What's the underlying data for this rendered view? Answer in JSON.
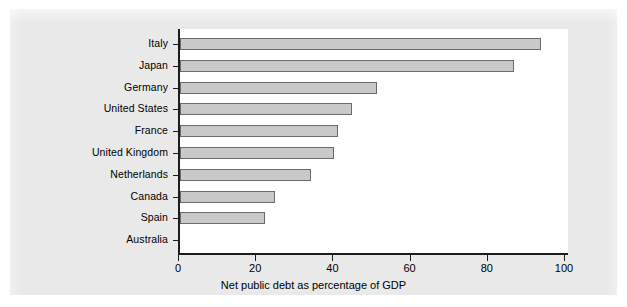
{
  "chart_data": {
    "type": "bar",
    "orientation": "horizontal",
    "title": "",
    "xlabel": "Net public debt as percentage of GDP",
    "ylabel": "",
    "categories": [
      "Italy",
      "Japan",
      "Germany",
      "United States",
      "France",
      "United Kingdom",
      "Netherlands",
      "Canada",
      "Spain",
      "Australia"
    ],
    "values": [
      93.5,
      86.5,
      51.0,
      44.5,
      41.0,
      40.0,
      34.0,
      24.5,
      22.0,
      0.0
    ],
    "xlim": [
      0,
      100
    ],
    "ylim": null,
    "xticks": [
      0,
      20,
      40,
      60,
      80,
      100
    ],
    "xtick_labels": [
      "0",
      "20",
      "40",
      "60",
      "80",
      "100"
    ],
    "grid": false,
    "legend": null,
    "bar_color": "#c9c9c9",
    "bar_edge_color": "#6b6b6b",
    "axis_color": "#1d1d1d",
    "plot_background": "#ffffff",
    "figure_background": "#e9e9e9"
  }
}
